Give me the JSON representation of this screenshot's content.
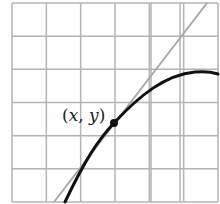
{
  "diagram": {
    "title": "",
    "grid": {
      "left": 12,
      "top": 3,
      "right": 218,
      "bottom": 202,
      "columns": 6,
      "rows": 6,
      "line_color": "#b4b4b4",
      "extra_vertical_lines": [
        151,
        180
      ]
    },
    "tangent_line": {
      "color": "#a8a8a8",
      "from": [
        54,
        202
      ],
      "to": [
        207,
        3
      ]
    },
    "curve": {
      "color": "#111111",
      "path": "M 65 202 C 85 160, 98 140, 114 123 C 140 95, 165 75, 195 72 C 205 71, 212 72, 218 74"
    },
    "point": {
      "x": 114,
      "y": 123,
      "color": "#111111",
      "label_open": "(",
      "label_x": "x",
      "label_sep": ", ",
      "label_y": "y",
      "label_close": ")"
    }
  }
}
